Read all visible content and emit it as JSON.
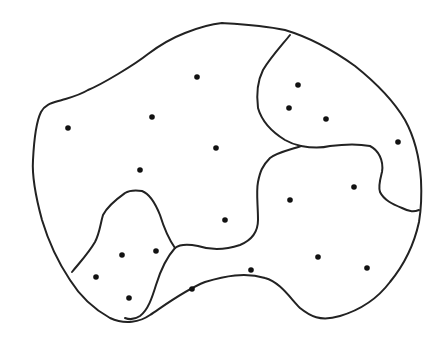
{
  "diagram": {
    "type": "partitioned-region-map",
    "stroke_color": "#222222",
    "dot_color": "#111111",
    "background": "#ffffff",
    "region_count": 5,
    "dots": [
      {
        "x": 197,
        "y": 77
      },
      {
        "x": 68,
        "y": 128
      },
      {
        "x": 152,
        "y": 117
      },
      {
        "x": 216,
        "y": 148
      },
      {
        "x": 140,
        "y": 170
      },
      {
        "x": 298,
        "y": 85
      },
      {
        "x": 289,
        "y": 108
      },
      {
        "x": 326,
        "y": 119
      },
      {
        "x": 398,
        "y": 142
      },
      {
        "x": 290,
        "y": 200
      },
      {
        "x": 354,
        "y": 187
      },
      {
        "x": 225,
        "y": 220
      },
      {
        "x": 122,
        "y": 255
      },
      {
        "x": 156,
        "y": 251
      },
      {
        "x": 96,
        "y": 277
      },
      {
        "x": 129,
        "y": 298
      },
      {
        "x": 192,
        "y": 289
      },
      {
        "x": 251,
        "y": 270
      },
      {
        "x": 318,
        "y": 257
      },
      {
        "x": 367,
        "y": 268
      }
    ]
  }
}
